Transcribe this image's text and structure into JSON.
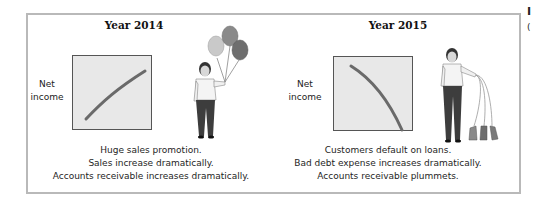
{
  "panels": [
    {
      "title": "Year 2014",
      "ylabel_lines": [
        "Net",
        "income"
      ],
      "trend": "increasing",
      "figure": "woman-holding-inflated-balloons",
      "caption": [
        "Huge sales promotion.",
        "Sales increase dramatically.",
        "Accounts receivable increases dramatically."
      ]
    },
    {
      "title": "Year 2015",
      "ylabel_lines": [
        "Net",
        "income"
      ],
      "trend": "decreasing",
      "figure": "woman-holding-deflated-balloons",
      "caption": [
        "Customers default on loans.",
        "Bad debt expense increases dramatically.",
        "Accounts receivable plummets."
      ]
    }
  ],
  "clipped_margin_text": [
    "I",
    "("
  ],
  "colors": {
    "frame_border": "#b9b9b9",
    "chart_fill": "#e8e8e8",
    "trend_line": "#6a6a6a",
    "balloon_light": "#c9c9c9",
    "balloon_mid": "#8a8a8a",
    "balloon_dark": "#6e6e6e"
  }
}
